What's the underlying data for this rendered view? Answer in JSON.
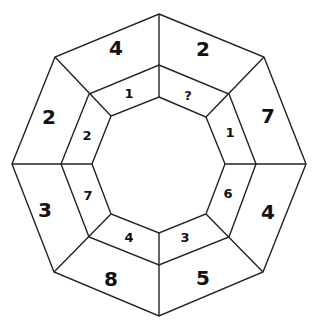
{
  "puzzle": {
    "outer_ring": [
      {
        "position": "top-left",
        "value": "4"
      },
      {
        "position": "top-right",
        "value": "2"
      },
      {
        "position": "right-top",
        "value": "7"
      },
      {
        "position": "right-bottom",
        "value": "4"
      },
      {
        "position": "bottom-right",
        "value": "5"
      },
      {
        "position": "bottom-left",
        "value": "8"
      },
      {
        "position": "left-bottom",
        "value": "3"
      },
      {
        "position": "left-top",
        "value": "2"
      }
    ],
    "inner_ring": [
      {
        "position": "top-left",
        "value": "1"
      },
      {
        "position": "top-right",
        "value": "?"
      },
      {
        "position": "right-top",
        "value": "1"
      },
      {
        "position": "right-bottom",
        "value": "6"
      },
      {
        "position": "bottom-right",
        "value": "3"
      },
      {
        "position": "bottom-left",
        "value": "4"
      },
      {
        "position": "left-bottom",
        "value": "7"
      },
      {
        "position": "left-top",
        "value": "2"
      }
    ]
  }
}
